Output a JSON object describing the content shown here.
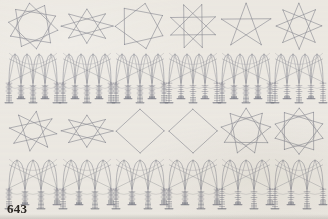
{
  "page": {
    "folio": "643",
    "paper_color": "#f2f0ec",
    "ink_color": "#8a8c96",
    "ink_color_dark": "#6e7180",
    "folio_color": "#2a2723",
    "width": 328,
    "height": 219
  },
  "plate": {
    "rows": 4,
    "columns": 6,
    "description": "Grid of geometric construction diagrams: alternating rows of star polygons and gothic tracery elevations"
  },
  "figures": [
    {
      "row": 1,
      "col": 1,
      "kind": "star-polygon",
      "label": "fig-r1c1",
      "points": 10,
      "step": 3,
      "cx": 33,
      "cy": 26,
      "rx": 25,
      "ry": 23,
      "rotation": -8,
      "inner_circle": true
    },
    {
      "row": 1,
      "col": 2,
      "kind": "star-polygon",
      "label": "fig-r1c2",
      "points": 8,
      "step": 3,
      "cx": 87,
      "cy": 26,
      "rx": 26,
      "ry": 17,
      "rotation": 0,
      "inner_circle": false
    },
    {
      "row": 1,
      "col": 3,
      "kind": "star-polygon",
      "label": "fig-r1c3",
      "points": 7,
      "step": 2,
      "cx": 140,
      "cy": 26,
      "rx": 25,
      "ry": 23,
      "rotation": 12,
      "inner_circle": false
    },
    {
      "row": 1,
      "col": 4,
      "kind": "star-polygon",
      "label": "fig-r1c4",
      "points": 8,
      "step": 3,
      "cx": 193,
      "cy": 26,
      "rx": 24,
      "ry": 23,
      "rotation": 22,
      "inner_circle": false
    },
    {
      "row": 1,
      "col": 5,
      "kind": "star-polygon",
      "label": "fig-r1c5",
      "points": 5,
      "step": 2,
      "cx": 246,
      "cy": 26,
      "rx": 26,
      "ry": 23,
      "rotation": 0,
      "inner_circle": false
    },
    {
      "row": 1,
      "col": 6,
      "kind": "star-polygon",
      "label": "fig-r1c6",
      "points": 8,
      "step": 3,
      "cx": 299,
      "cy": 26,
      "rx": 23,
      "ry": 23,
      "rotation": 45,
      "inner_circle": false
    },
    {
      "row": 2,
      "col": 1,
      "kind": "tracery-elevation",
      "label": "fig-r2c1",
      "cx": 33,
      "top": 52,
      "bottom": 104,
      "mullions": 5,
      "arch_pairs": 2,
      "tick_density": "high"
    },
    {
      "row": 2,
      "col": 2,
      "kind": "tracery-elevation",
      "label": "fig-r2c2",
      "cx": 87,
      "top": 52,
      "bottom": 104,
      "mullions": 5,
      "arch_pairs": 2,
      "tick_density": "high"
    },
    {
      "row": 2,
      "col": 3,
      "kind": "tracery-elevation",
      "label": "fig-r2c3",
      "cx": 140,
      "top": 52,
      "bottom": 104,
      "mullions": 5,
      "arch_pairs": 2,
      "tick_density": "high"
    },
    {
      "row": 2,
      "col": 4,
      "kind": "tracery-elevation",
      "label": "fig-r2c4",
      "cx": 193,
      "top": 52,
      "bottom": 104,
      "mullions": 5,
      "arch_pairs": 2,
      "tick_density": "medium"
    },
    {
      "row": 2,
      "col": 5,
      "kind": "tracery-elevation",
      "label": "fig-r2c5",
      "cx": 246,
      "top": 52,
      "bottom": 104,
      "mullions": 5,
      "arch_pairs": 2,
      "tick_density": "high"
    },
    {
      "row": 2,
      "col": 6,
      "kind": "tracery-elevation",
      "label": "fig-r2c6",
      "cx": 299,
      "top": 52,
      "bottom": 104,
      "mullions": 5,
      "arch_pairs": 2,
      "tick_density": "medium"
    },
    {
      "row": 3,
      "col": 1,
      "kind": "star-polygon",
      "label": "fig-r3c1",
      "points": 8,
      "step": 3,
      "cx": 33,
      "cy": 131,
      "rx": 24,
      "ry": 20,
      "rotation": 8,
      "inner_circle": false
    },
    {
      "row": 3,
      "col": 2,
      "kind": "star-polygon",
      "label": "fig-r3c2",
      "points": 8,
      "step": 3,
      "cx": 87,
      "cy": 131,
      "rx": 26,
      "ry": 16,
      "rotation": 0,
      "inner_circle": false
    },
    {
      "row": 3,
      "col": 3,
      "kind": "star-polygon",
      "label": "fig-r3c3",
      "points": 4,
      "step": 1,
      "cx": 140,
      "cy": 131,
      "rx": 24,
      "ry": 22,
      "rotation": 0,
      "inner_circle": false
    },
    {
      "row": 3,
      "col": 4,
      "kind": "star-polygon",
      "label": "fig-r3c4",
      "points": 4,
      "step": 1,
      "cx": 193,
      "cy": 131,
      "rx": 24,
      "ry": 22,
      "rotation": 0,
      "inner_circle": false
    },
    {
      "row": 3,
      "col": 5,
      "kind": "star-polygon",
      "label": "fig-r3c5",
      "points": 9,
      "step": 3,
      "cx": 246,
      "cy": 131,
      "rx": 25,
      "ry": 23,
      "rotation": 0,
      "inner_circle": true
    },
    {
      "row": 3,
      "col": 6,
      "kind": "star-polygon",
      "label": "fig-r3c6",
      "points": 10,
      "step": 3,
      "cx": 299,
      "cy": 131,
      "rx": 25,
      "ry": 23,
      "rotation": 0,
      "inner_circle": true
    },
    {
      "row": 4,
      "col": 1,
      "kind": "tracery-elevation",
      "label": "fig-r4c1",
      "cx": 33,
      "top": 158,
      "bottom": 210,
      "mullions": 4,
      "arch_pairs": 1,
      "tick_density": "high"
    },
    {
      "row": 4,
      "col": 2,
      "kind": "tracery-elevation",
      "label": "fig-r4c2",
      "cx": 87,
      "top": 158,
      "bottom": 210,
      "mullions": 4,
      "arch_pairs": 1,
      "tick_density": "high"
    },
    {
      "row": 4,
      "col": 3,
      "kind": "tracery-elevation",
      "label": "fig-r4c3",
      "cx": 140,
      "top": 158,
      "bottom": 210,
      "mullions": 4,
      "arch_pairs": 1,
      "tick_density": "high"
    },
    {
      "row": 4,
      "col": 4,
      "kind": "tracery-elevation",
      "label": "fig-r4c4",
      "cx": 193,
      "top": 158,
      "bottom": 210,
      "mullions": 4,
      "arch_pairs": 1,
      "tick_density": "high"
    },
    {
      "row": 4,
      "col": 5,
      "kind": "tracery-elevation",
      "label": "fig-r4c5",
      "cx": 246,
      "top": 158,
      "bottom": 210,
      "mullions": 4,
      "arch_pairs": 1,
      "tick_density": "medium"
    },
    {
      "row": 4,
      "col": 6,
      "kind": "tracery-elevation",
      "label": "fig-r4c6",
      "cx": 299,
      "top": 158,
      "bottom": 210,
      "mullions": 4,
      "arch_pairs": 1,
      "tick_density": "medium"
    }
  ]
}
